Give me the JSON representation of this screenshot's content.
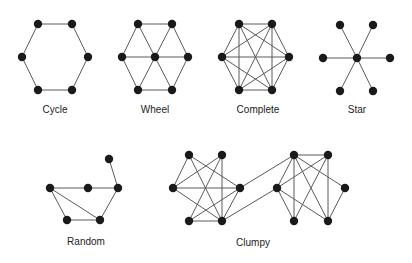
{
  "graphs": [
    {
      "name": "Cycle",
      "label_pos": [
        55,
        110
      ],
      "nodes": [
        [
          38,
          24
        ],
        [
          72,
          24
        ],
        [
          22,
          57
        ],
        [
          88,
          57
        ],
        [
          38,
          90
        ],
        [
          72,
          90
        ]
      ],
      "edges": [
        [
          0,
          1
        ],
        [
          1,
          3
        ],
        [
          3,
          5
        ],
        [
          5,
          4
        ],
        [
          4,
          2
        ],
        [
          2,
          0
        ]
      ]
    },
    {
      "name": "Wheel",
      "label_pos": [
        155,
        110
      ],
      "nodes": [
        [
          138,
          24
        ],
        [
          172,
          24
        ],
        [
          122,
          57
        ],
        [
          155,
          57
        ],
        [
          188,
          57
        ],
        [
          138,
          90
        ],
        [
          172,
          90
        ]
      ],
      "edges": [
        [
          0,
          1
        ],
        [
          1,
          4
        ],
        [
          4,
          6
        ],
        [
          6,
          5
        ],
        [
          5,
          2
        ],
        [
          2,
          0
        ],
        [
          3,
          0
        ],
        [
          3,
          1
        ],
        [
          3,
          2
        ],
        [
          3,
          4
        ],
        [
          3,
          5
        ],
        [
          3,
          6
        ]
      ]
    },
    {
      "name": "Complete",
      "label_pos": [
        258,
        110
      ],
      "nodes": [
        [
          239,
          24
        ],
        [
          272,
          24
        ],
        [
          222,
          57
        ],
        [
          289,
          57
        ],
        [
          239,
          90
        ],
        [
          272,
          90
        ]
      ],
      "edges": [
        [
          0,
          1
        ],
        [
          0,
          2
        ],
        [
          0,
          3
        ],
        [
          0,
          4
        ],
        [
          0,
          5
        ],
        [
          1,
          2
        ],
        [
          1,
          3
        ],
        [
          1,
          4
        ],
        [
          1,
          5
        ],
        [
          2,
          3
        ],
        [
          2,
          4
        ],
        [
          2,
          5
        ],
        [
          3,
          4
        ],
        [
          3,
          5
        ],
        [
          4,
          5
        ]
      ]
    },
    {
      "name": "Star",
      "label_pos": [
        357,
        110
      ],
      "nodes": [
        [
          340,
          25
        ],
        [
          373,
          25
        ],
        [
          323,
          58
        ],
        [
          357,
          58
        ],
        [
          390,
          58
        ],
        [
          340,
          91
        ],
        [
          373,
          91
        ]
      ],
      "edges": [
        [
          3,
          0
        ],
        [
          3,
          1
        ],
        [
          3,
          2
        ],
        [
          3,
          4
        ],
        [
          3,
          5
        ],
        [
          3,
          6
        ]
      ]
    },
    {
      "name": "Random",
      "label_pos": [
        86,
        242
      ],
      "nodes": [
        [
          109,
          159
        ],
        [
          50,
          188
        ],
        [
          88,
          188
        ],
        [
          118,
          188
        ],
        [
          67,
          220
        ],
        [
          100,
          220
        ]
      ],
      "edges": [
        [
          0,
          3
        ],
        [
          1,
          2
        ],
        [
          2,
          3
        ],
        [
          1,
          5
        ],
        [
          1,
          4
        ],
        [
          4,
          5
        ],
        [
          5,
          3
        ]
      ]
    },
    {
      "name": "Clumpy",
      "label_pos": [
        253,
        243
      ],
      "nodes": [
        [
          189,
          155
        ],
        [
          222,
          155
        ],
        [
          173,
          188
        ],
        [
          240,
          188
        ],
        [
          189,
          221
        ],
        [
          222,
          221
        ],
        [
          294,
          155
        ],
        [
          328,
          155
        ],
        [
          277,
          188
        ],
        [
          345,
          188
        ],
        [
          294,
          221
        ],
        [
          328,
          221
        ]
      ],
      "edges": [
        [
          0,
          2
        ],
        [
          0,
          3
        ],
        [
          0,
          5
        ],
        [
          1,
          2
        ],
        [
          1,
          4
        ],
        [
          1,
          5
        ],
        [
          2,
          3
        ],
        [
          2,
          5
        ],
        [
          4,
          3
        ],
        [
          4,
          5
        ],
        [
          3,
          5
        ],
        [
          6,
          7
        ],
        [
          6,
          8
        ],
        [
          6,
          10
        ],
        [
          6,
          11
        ],
        [
          6,
          9
        ],
        [
          7,
          8
        ],
        [
          7,
          10
        ],
        [
          7,
          11
        ],
        [
          8,
          10
        ],
        [
          8,
          11
        ],
        [
          9,
          11
        ],
        [
          3,
          6
        ],
        [
          5,
          8
        ]
      ]
    }
  ],
  "colors": {
    "node": "#1a1a1a",
    "edge": "#5a5a5a",
    "label": "#222222"
  }
}
